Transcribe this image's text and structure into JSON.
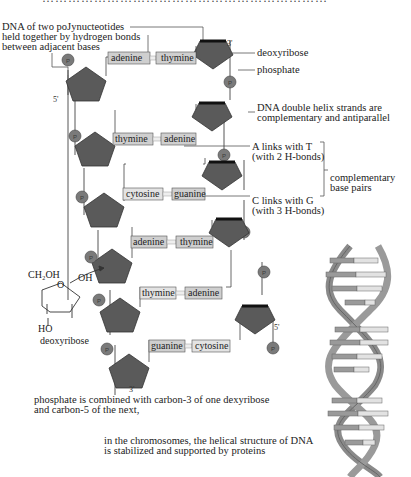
{
  "top_cut_text": "…………………………………………………………",
  "labels": {
    "polynucleotide_note": [
      "DNA of two poJynucteotides",
      "held together by hydrogen bonds",
      "between adjacent bases"
    ],
    "deoxyribose": "deoxyribose",
    "phosphate": "phosphate",
    "strands_note": [
      "DNA double helix strands are",
      "complementary and antiparallel"
    ],
    "at_pair": [
      "A links with T",
      "(with 2 H-bonds)"
    ],
    "cg_pair": [
      "C links with G",
      "(with 3 H-bonds)"
    ],
    "complementary": [
      "complementary",
      "base pairs"
    ],
    "prime3_top": "3'",
    "prime5_left": "5'",
    "prime5_right": "5'",
    "prime3_bottom": "3'",
    "phosphate_note": [
      "phosphate is combined with carbon-3 of one dexyribose",
      "and carbon-5 of the next,"
    ],
    "chromosome_note": [
      "in the chromosomes, the helical structure of DNA",
      "is stabilized and supported by proteins"
    ],
    "sugar_structure": {
      "ch2oh": "CH₂OH",
      "oh": "OH",
      "o": "O",
      "ho": "HO",
      "name": "deoxyribose"
    },
    "phosphate_symbol": "P"
  },
  "base_pairs": [
    {
      "left": "adenine",
      "right": "thymine",
      "bonds": 2
    },
    {
      "left": "thymine",
      "right": "adenine",
      "bonds": 2
    },
    {
      "left": "cytosine",
      "right": "guanine",
      "bonds": 3
    },
    {
      "left": "adenine",
      "right": "thymine",
      "bonds": 2
    },
    {
      "left": "thymine",
      "right": "adenine",
      "bonds": 2
    },
    {
      "left": "guanine",
      "right": "cytosine",
      "bonds": 3
    }
  ],
  "colors": {
    "sugar_fill": "#5a5a5a",
    "sugar_edge": "#1a1a1a",
    "phosphate_fill": "#7a7a7a",
    "base_fill": "#cfcfcf",
    "base_edge": "#555555",
    "backbone_line": "#444444",
    "helix_ribbon": "#8a8a8a",
    "helix_rung_dark": "#9a9a9a",
    "helix_rung_light": "#e2e2e2"
  }
}
